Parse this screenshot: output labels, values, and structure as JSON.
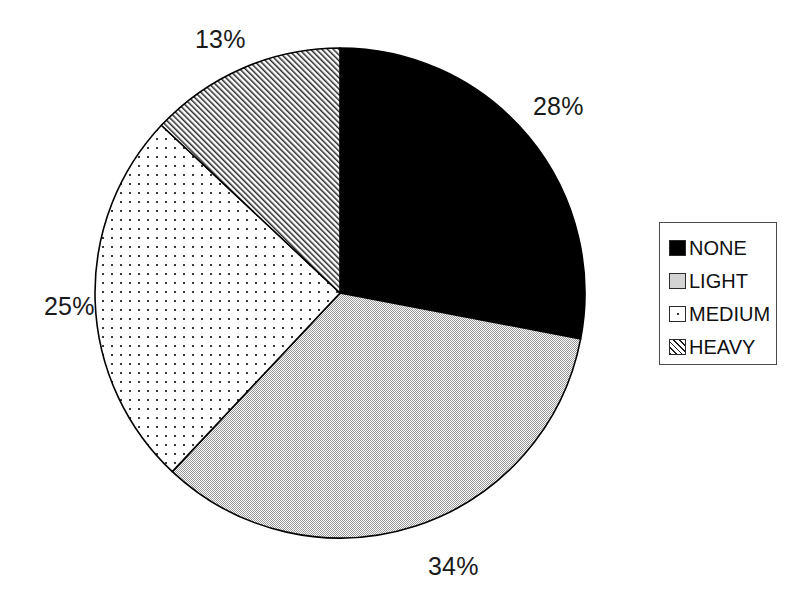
{
  "chart_data": {
    "type": "pie",
    "title": "",
    "subtitle": "",
    "xlabel": "",
    "ylabel": "",
    "categories": [
      "NONE",
      "LIGHT",
      "MEDIUM",
      "HEAVY"
    ],
    "values": [
      28,
      34,
      25,
      13
    ],
    "value_unit": "%",
    "data_labels": [
      "28%",
      "34%",
      "25%",
      "13%"
    ],
    "start_angle_deg": 0,
    "direction": "clockwise",
    "legend": {
      "position": "right",
      "bordered": true,
      "entries": [
        {
          "label": "NONE",
          "value": 28,
          "data_label": "28%",
          "swatch": "solid-black",
          "color": "#000000"
        },
        {
          "label": "LIGHT",
          "value": 34,
          "data_label": "34%",
          "swatch": "light-gray-fill",
          "color": "#d4d4d4"
        },
        {
          "label": "MEDIUM",
          "value": 25,
          "data_label": "25%",
          "swatch": "dotted-fill",
          "color": "#ffffff"
        },
        {
          "label": "HEAVY",
          "value": 13,
          "data_label": "13%",
          "swatch": "diagonal-hatch",
          "color": "#ffffff"
        }
      ]
    },
    "grid": false,
    "slices": [
      {
        "name": "NONE",
        "value": 28,
        "label": "28%",
        "start_deg": 0.0,
        "end_deg": 100.8,
        "fill": "solid-black",
        "label_x": 533,
        "label_y": 94
      },
      {
        "name": "LIGHT",
        "value": 34,
        "label": "34%",
        "start_deg": 100.8,
        "end_deg": 223.2,
        "fill": "light-gray-fill",
        "label_x": 428,
        "label_y": 554
      },
      {
        "name": "MEDIUM",
        "value": 25,
        "label": "25%",
        "start_deg": 223.2,
        "end_deg": 313.2,
        "fill": "dotted-fill",
        "label_x": 44,
        "label_y": 294
      },
      {
        "name": "HEAVY",
        "value": 13,
        "label": "13%",
        "start_deg": 313.2,
        "end_deg": 360.0,
        "fill": "diagonal-hatch",
        "label_x": 195,
        "label_y": 27
      }
    ],
    "geometry": {
      "center_x": 340,
      "center_y": 293,
      "radius": 245
    }
  }
}
